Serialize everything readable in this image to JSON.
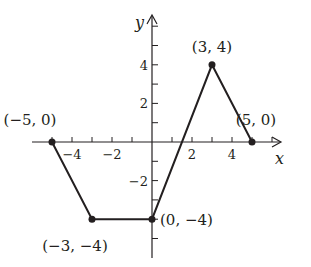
{
  "chart_data": {
    "type": "line",
    "title": "",
    "xlabel": "x",
    "ylabel": "y",
    "xlim": [
      -5.5,
      6.5
    ],
    "ylim": [
      -5.5,
      6
    ],
    "grid": false,
    "x_ticks": [
      -4,
      -2,
      2,
      4
    ],
    "y_ticks": [
      4,
      2,
      -2
    ],
    "x_tick_labels": [
      "−4",
      "−2",
      "2",
      "4"
    ],
    "y_tick_labels": [
      "4",
      "2",
      "−2"
    ],
    "series": [
      {
        "name": "piecewise linear",
        "x": [
          -5,
          -3,
          0,
          3,
          5
        ],
        "y": [
          0,
          -4,
          -4,
          4,
          0
        ]
      }
    ],
    "annotations": [
      {
        "text": "(−5, 0)",
        "x": -5,
        "y": 0
      },
      {
        "text": "(−3, −4)",
        "x": -3,
        "y": -4
      },
      {
        "text": "(0, −4)",
        "x": 0,
        "y": -4
      },
      {
        "text": "(3, 4)",
        "x": 3,
        "y": 4
      },
      {
        "text": "(5, 0)",
        "x": 5,
        "y": 0
      }
    ],
    "colors": {
      "line": "#231f20",
      "axis": "#231f20",
      "point": "#231f20"
    }
  }
}
